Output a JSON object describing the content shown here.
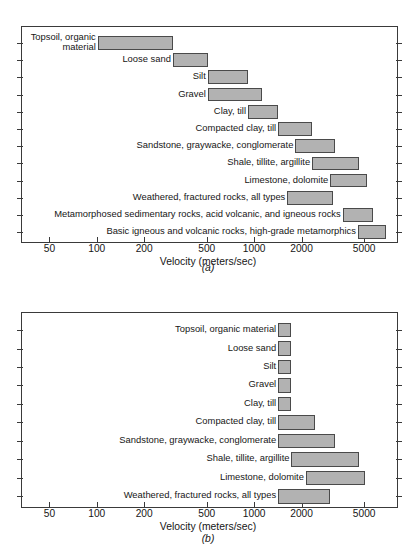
{
  "figure": {
    "panels": [
      {
        "id": "a",
        "caption": "(a)",
        "xlabel": "Velocity (meters/sec)",
        "xticks": [
          {
            "label": "50",
            "value": 50
          },
          {
            "label": "100",
            "value": 100
          },
          {
            "label": "200",
            "value": 200
          },
          {
            "label": "500",
            "value": 500
          },
          {
            "label": "1000",
            "value": 1000
          },
          {
            "label": "2000",
            "value": 2000
          },
          {
            "label": "5000",
            "value": 5000
          }
        ]
      },
      {
        "id": "b",
        "caption": "(b)",
        "xlabel": "Velocity (meters/sec)",
        "xticks": [
          {
            "label": "50",
            "value": 50
          },
          {
            "label": "100",
            "value": 100
          },
          {
            "label": "200",
            "value": 200
          },
          {
            "label": "500",
            "value": 500
          },
          {
            "label": "1000",
            "value": 1000
          },
          {
            "label": "2000",
            "value": 2000
          },
          {
            "label": "5000",
            "value": 5000
          }
        ]
      }
    ]
  },
  "chart_data": [
    {
      "type": "bar",
      "orientation": "horizontal",
      "title": "",
      "panel": "(a)",
      "xlabel": "Velocity (meters/sec)",
      "ylabel": "",
      "xscale": "log",
      "xlim": [
        30,
        8000
      ],
      "xticks": [
        50,
        100,
        200,
        500,
        1000,
        2000,
        5000
      ],
      "xticklabels": [
        "50",
        "100",
        "200",
        "500",
        "1000",
        "2000",
        "5000"
      ],
      "grid": false,
      "legend": null,
      "bar_color": "#b2b2b2",
      "bar_edge_color": "#4a4a4a",
      "categories": [
        "Topsoil, organic material",
        "Loose sand",
        "Silt",
        "Gravel",
        "Clay, till",
        "Compacted clay, till",
        "Sandstone, graywacke, conglomerate",
        "Shale, tillite, argillite",
        "Limestone, dolomite",
        "Weathered, fractured rocks, all types",
        "Metamorphosed sedimentary rocks, acid volcanic, and igneous rocks",
        "Basic igneous and volcanic rocks, high-grade metamorphics"
      ],
      "ranges": [
        {
          "category": "Topsoil, organic material",
          "low": 100,
          "high": 300
        },
        {
          "category": "Loose sand",
          "low": 300,
          "high": 500
        },
        {
          "category": "Silt",
          "low": 500,
          "high": 900
        },
        {
          "category": "Gravel",
          "low": 500,
          "high": 1100
        },
        {
          "category": "Clay, till",
          "low": 900,
          "high": 1400
        },
        {
          "category": "Compacted clay, till",
          "low": 1400,
          "high": 2300
        },
        {
          "category": "Sandstone, graywacke, conglomerate",
          "low": 1800,
          "high": 3200
        },
        {
          "category": "Shale, tillite, argillite",
          "low": 2300,
          "high": 4600
        },
        {
          "category": "Limestone, dolomite",
          "low": 3000,
          "high": 5100
        },
        {
          "category": "Weathered, fractured rocks, all types",
          "low": 1600,
          "high": 3100
        },
        {
          "category": "Metamorphosed sedimentary rocks, acid volcanic, and igneous rocks",
          "low": 3600,
          "high": 5600
        },
        {
          "category": "Basic igneous and volcanic rocks, high-grade metamorphics",
          "low": 4500,
          "high": 6800
        }
      ]
    },
    {
      "type": "bar",
      "orientation": "horizontal",
      "title": "",
      "panel": "(b)",
      "xlabel": "Velocity (meters/sec)",
      "ylabel": "",
      "xscale": "log",
      "xlim": [
        30,
        8000
      ],
      "xticks": [
        50,
        100,
        200,
        500,
        1000,
        2000,
        5000
      ],
      "xticklabels": [
        "50",
        "100",
        "200",
        "500",
        "1000",
        "2000",
        "5000"
      ],
      "grid": false,
      "legend": null,
      "bar_color": "#b2b2b2",
      "bar_edge_color": "#4a4a4a",
      "categories": [
        "Topsoil, organic material",
        "Loose sand",
        "Silt",
        "Gravel",
        "Clay, till",
        "Compacted clay, till",
        "Sandstone, graywacke, conglomerate",
        "Shale, tillite, argillite",
        "Limestone, dolomite",
        "Weathered, fractured rocks, all types"
      ],
      "ranges": [
        {
          "category": "Topsoil, organic material",
          "low": 1400,
          "high": 1700
        },
        {
          "category": "Loose sand",
          "low": 1400,
          "high": 1700
        },
        {
          "category": "Silt",
          "low": 1400,
          "high": 1700
        },
        {
          "category": "Gravel",
          "low": 1400,
          "high": 1700
        },
        {
          "category": "Clay, till",
          "low": 1400,
          "high": 1700
        },
        {
          "category": "Compacted clay, till",
          "low": 1400,
          "high": 2400
        },
        {
          "category": "Sandstone, graywacke, conglomerate",
          "low": 1400,
          "high": 3200
        },
        {
          "category": "Shale, tillite, argillite",
          "low": 1700,
          "high": 4600
        },
        {
          "category": "Limestone, dolomite",
          "low": 2100,
          "high": 5000
        },
        {
          "category": "Weathered, fractured rocks, all types",
          "low": 1400,
          "high": 3000
        }
      ]
    }
  ]
}
